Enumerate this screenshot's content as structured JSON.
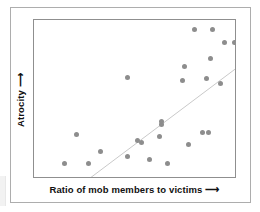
{
  "figure": {
    "background_color": "#ffffff",
    "outer_border_color": "#adadad",
    "plot_border_color": "#8f8f8f"
  },
  "axes": {
    "x_label_text": "Ratio of mob members to victims",
    "x_label_arrow": "⟶",
    "y_label_text": "Atrocity",
    "y_label_arrow": "⟶"
  },
  "chart_data": {
    "type": "scatter",
    "title": "",
    "xlabel": "Ratio of mob members to victims ⟶",
    "ylabel": "Atrocity ⟶",
    "xlim": [
      0,
      100
    ],
    "ylim": [
      0,
      100
    ],
    "grid": false,
    "legend": "none",
    "axis_ticks": "none",
    "marker_color": "#8d8d8d",
    "marker_size_px": 5,
    "trendline": {
      "visible": true,
      "color": "#c9c9c9",
      "width_px": 1,
      "x_start": 27,
      "y_start": 0,
      "x_end": 100,
      "y_end": 70
    },
    "points": [
      {
        "x": 88,
        "y": 94
      },
      {
        "x": 27,
        "y": 10
      },
      {
        "x": 21,
        "y": 28
      },
      {
        "x": 15,
        "y": 10
      },
      {
        "x": 46,
        "y": 64
      },
      {
        "x": 79,
        "y": 94
      },
      {
        "x": 94,
        "y": 86
      },
      {
        "x": 99,
        "y": 86
      },
      {
        "x": 87,
        "y": 76
      },
      {
        "x": 85,
        "y": 63
      },
      {
        "x": 73,
        "y": 62
      },
      {
        "x": 74,
        "y": 71
      },
      {
        "x": 92,
        "y": 60
      },
      {
        "x": 63,
        "y": 34
      },
      {
        "x": 63,
        "y": 36
      },
      {
        "x": 62,
        "y": 27
      },
      {
        "x": 51,
        "y": 24
      },
      {
        "x": 53,
        "y": 23
      },
      {
        "x": 46,
        "y": 14
      },
      {
        "x": 57,
        "y": 12
      },
      {
        "x": 66,
        "y": 10
      },
      {
        "x": 33,
        "y": 17
      },
      {
        "x": 76,
        "y": 22
      },
      {
        "x": 83,
        "y": 29
      },
      {
        "x": 86,
        "y": 29
      }
    ]
  }
}
